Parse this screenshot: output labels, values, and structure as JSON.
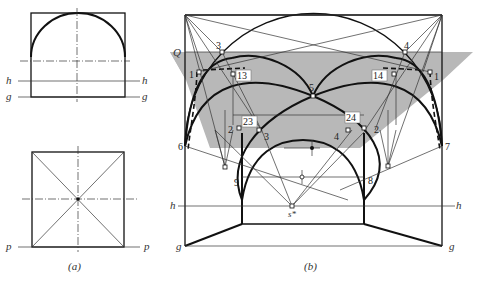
{
  "figure_a": {
    "caption": "(a)",
    "elevation": {
      "labels": {
        "h_left": "h",
        "h_right": "h",
        "g_left": "g",
        "g_right": "g"
      }
    },
    "plan": {
      "labels": {
        "p_left": "p",
        "p_right": "p"
      }
    }
  },
  "figure_b": {
    "caption": "(b)",
    "plane_label": "Q",
    "shade_color": "#b8b8b8",
    "points": {
      "p1_left": "1",
      "p1_right": "1",
      "p2_left": "2",
      "p2_right": "2",
      "p3_top": "3",
      "p3_low": "3",
      "p4_top": "4",
      "p4_low": "4",
      "p5": "5",
      "p6": "6",
      "p7": "7",
      "p8": "8",
      "p9": "9",
      "p13": "13",
      "p14": "14",
      "p23": "23",
      "p24": "24",
      "s_star": "s*"
    },
    "lines": {
      "h_left": "h",
      "h_right": "h",
      "g_left": "g",
      "g_right": "g"
    }
  }
}
